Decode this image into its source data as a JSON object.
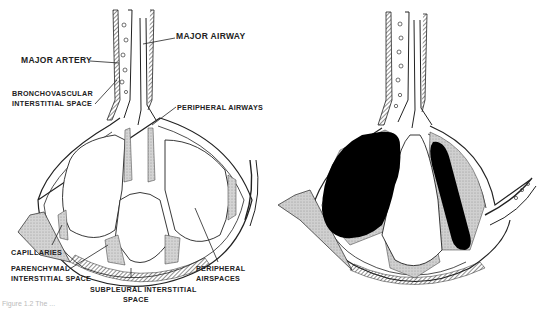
{
  "figure": {
    "caption_partial": "Figure 1.2 The ...",
    "panels": [
      {
        "id": "left",
        "description": "Normal lung lobule anatomy, labeled",
        "labels": {
          "major_airway": "MAJOR AIRWAY",
          "major_artery": "MAJOR ARTERY",
          "bronchovascular_1": "BRONCHOVASCULAR",
          "bronchovascular_2": "INTERSTITIAL SPACE",
          "peripheral_airways": "PERIPHERAL AIRWAYS",
          "capillaries": "CAPILLARIES",
          "parenchymal_1": "PARENCHYMAL",
          "parenchymal_2": "INTERSTITIAL SPACE",
          "subpleural_1": "SUBPLEURAL INTERSTITIAL",
          "subpleural_2": "SPACE",
          "peripheral_airspaces_1": "PERIPHERAL",
          "peripheral_airspaces_2": "AIRSPACES"
        }
      },
      {
        "id": "right",
        "description": "Same lobule with airspace filling (black consolidation)",
        "labels": {}
      }
    ],
    "colors": {
      "ink": "#1a1a1a",
      "stipple": "#c8c8c8",
      "fill_black": "#000000",
      "background": "#ffffff"
    }
  }
}
